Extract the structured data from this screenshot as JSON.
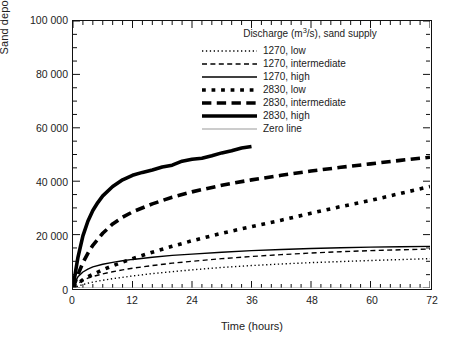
{
  "chart_data": {
    "type": "line",
    "title": "",
    "xlabel": "Time (hours)",
    "ylabel": "Sand deposit volume (m3)",
    "ylabel_base": "Sand deposit volume (m",
    "ylabel_exp": "3",
    "ylabel_tail": ")",
    "xlim": [
      0,
      72
    ],
    "ylim": [
      0,
      100000
    ],
    "xticks": [
      0,
      12,
      24,
      36,
      48,
      60,
      72
    ],
    "xtick_labels": [
      "0",
      "12",
      "24",
      "36",
      "48",
      "60",
      "72"
    ],
    "yticks": [
      0,
      20000,
      40000,
      60000,
      80000,
      100000
    ],
    "ytick_labels": [
      "0",
      "20 000",
      "40 000",
      "60 000",
      "80 000",
      "100 000"
    ],
    "x_minor_interval": 2,
    "y_minor_interval": 5000,
    "grid": false,
    "legend_position": "top-right inside",
    "legend_title": "Discharge (m3/s), sand supply",
    "legend_title_base": "Discharge (m",
    "legend_title_exp": "3",
    "legend_title_tail": "/s), sand supply",
    "series": [
      {
        "name": "1270, low",
        "discharge": 1270,
        "sand_supply": "low",
        "style": "dotted",
        "width": 1.4,
        "color": "#000000",
        "x": [
          0,
          0.5,
          1,
          2,
          3,
          4,
          6,
          8,
          10,
          12,
          16,
          20,
          24,
          30,
          36,
          42,
          48,
          54,
          60,
          66,
          72
        ],
        "y": [
          0,
          300,
          700,
          1300,
          1800,
          2200,
          2900,
          3500,
          4000,
          4500,
          5400,
          6100,
          6800,
          7700,
          8400,
          9000,
          9500,
          9900,
          10300,
          10650,
          11000
        ]
      },
      {
        "name": "1270, intermediate",
        "discharge": 1270,
        "sand_supply": "intermediate",
        "style": "dashed",
        "width": 1.4,
        "color": "#000000",
        "x": [
          0,
          0.5,
          1,
          2,
          3,
          4,
          6,
          8,
          10,
          12,
          16,
          20,
          24,
          30,
          36,
          42,
          48,
          54,
          60,
          66,
          72
        ],
        "y": [
          0,
          900,
          1700,
          2900,
          3700,
          4300,
          5300,
          6100,
          6800,
          7400,
          8400,
          9300,
          10000,
          11000,
          11800,
          12500,
          13100,
          13600,
          14000,
          14300,
          14600
        ]
      },
      {
        "name": "1270, high",
        "discharge": 1270,
        "sand_supply": "high",
        "style": "solid",
        "width": 1.4,
        "color": "#000000",
        "x": [
          0,
          0.5,
          1,
          2,
          3,
          4,
          6,
          8,
          10,
          12,
          16,
          20,
          24,
          30,
          36,
          42,
          48,
          54,
          60,
          66,
          72
        ],
        "y": [
          0,
          2600,
          4200,
          6000,
          7100,
          7900,
          8900,
          9600,
          10200,
          10700,
          11500,
          12200,
          12700,
          13400,
          14000,
          14400,
          14800,
          15100,
          15300,
          15450,
          15600
        ]
      },
      {
        "name": "2830, low",
        "discharge": 2830,
        "sand_supply": "low",
        "style": "dotted",
        "width": 3.6,
        "color": "#000000",
        "x": [
          0,
          0.5,
          1,
          2,
          3,
          4,
          6,
          8,
          10,
          12,
          16,
          20,
          24,
          30,
          36,
          42,
          48,
          54,
          60,
          66,
          72
        ],
        "y": [
          0,
          800,
          1700,
          3100,
          4200,
          5100,
          6800,
          8300,
          9700,
          11000,
          13400,
          15600,
          17700,
          20500,
          23000,
          25400,
          28000,
          30500,
          32800,
          35400,
          38000
        ]
      },
      {
        "name": "2830, intermediate",
        "discharge": 2830,
        "sand_supply": "intermediate",
        "style": "dashed",
        "width": 3.6,
        "color": "#000000",
        "x": [
          0,
          0.5,
          1,
          2,
          3,
          4,
          6,
          8,
          10,
          12,
          16,
          20,
          24,
          30,
          36,
          42,
          48,
          54,
          60,
          66,
          72
        ],
        "y": [
          0,
          2500,
          5000,
          9500,
          13000,
          16000,
          20500,
          24000,
          26500,
          28500,
          31500,
          34000,
          36000,
          38500,
          40500,
          42200,
          43800,
          45200,
          46500,
          47800,
          49000
        ]
      },
      {
        "name": "2830, high",
        "discharge": 2830,
        "sand_supply": "high",
        "style": "solid",
        "width": 3.6,
        "color": "#000000",
        "x": [
          0,
          0.5,
          1,
          2,
          3,
          4,
          5,
          6,
          8,
          10,
          12,
          14,
          16,
          18,
          20,
          22,
          24,
          26,
          28,
          30,
          32,
          34,
          36
        ],
        "y": [
          0,
          6000,
          11500,
          19500,
          25000,
          29000,
          32000,
          34500,
          38000,
          40500,
          42200,
          43300,
          44200,
          45300,
          46000,
          47500,
          48200,
          48600,
          49500,
          50600,
          51400,
          52400,
          53000
        ]
      },
      {
        "name": "Zero line",
        "style": "solid",
        "width": 1.2,
        "color": "#9a9a9a",
        "x": [
          0,
          72
        ],
        "y": [
          0,
          0
        ]
      }
    ]
  },
  "legend": {
    "entries": [
      {
        "label": "1270, low",
        "key": "dotted-thin"
      },
      {
        "label": "1270, intermediate",
        "key": "dashed-thin"
      },
      {
        "label": "1270, high",
        "key": "solid-thin"
      },
      {
        "label": "2830, low",
        "key": "dotted-thick"
      },
      {
        "label": "2830, intermediate",
        "key": "dashed-thick"
      },
      {
        "label": "2830, high",
        "key": "solid-thick"
      },
      {
        "label": "Zero line",
        "key": "solid-gray"
      }
    ]
  }
}
